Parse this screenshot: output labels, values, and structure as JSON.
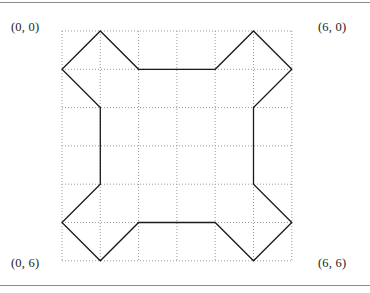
{
  "figure": {
    "corner_labels": {
      "top_left": "(0, 0)",
      "top_right": "(6, 0)",
      "bottom_left": "(0, 6)",
      "bottom_right": "(6, 6)"
    },
    "colors": {
      "rule": "#8a8a8a",
      "grid_dot": "#9a9a9a",
      "polygon_stroke": "#1a1a1a",
      "background": "#ffffff",
      "label_text": "#232323"
    }
  },
  "chart_data": {
    "type": "scatter",
    "title": "",
    "xlabel": "",
    "ylabel": "",
    "xlim": [
      0,
      6
    ],
    "ylim": [
      0,
      6
    ],
    "grid": true,
    "grid_style": "dotted",
    "grid_step": 1,
    "y_axis_inverted": true,
    "legend": "none",
    "annotations": [
      {
        "text": "(0, 0)",
        "position": "top-left"
      },
      {
        "text": "(6, 0)",
        "position": "top-right"
      },
      {
        "text": "(0, 6)",
        "position": "bottom-left"
      },
      {
        "text": "(6, 6)",
        "position": "bottom-right"
      }
    ],
    "series": [
      {
        "name": "polygon",
        "type": "closed-polyline",
        "closed": true,
        "points": [
          [
            1,
            0
          ],
          [
            2,
            1
          ],
          [
            4,
            1
          ],
          [
            5,
            0
          ],
          [
            6,
            1
          ],
          [
            5,
            2
          ],
          [
            5,
            4
          ],
          [
            6,
            5
          ],
          [
            5,
            6
          ],
          [
            4,
            5
          ],
          [
            2,
            5
          ],
          [
            1,
            6
          ],
          [
            0,
            5
          ],
          [
            1,
            4
          ],
          [
            1,
            2
          ],
          [
            0,
            1
          ]
        ]
      }
    ]
  },
  "geometry": {
    "origin_px": {
      "x": 62,
      "y": 31
    },
    "cell_px": 38.3,
    "cells": 6
  }
}
